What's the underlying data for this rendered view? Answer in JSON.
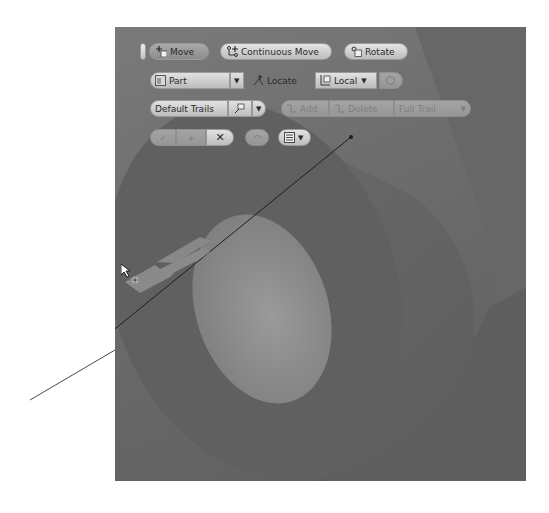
{
  "toolbar": {
    "row1": {
      "move_label": "Move",
      "continuous_move_label": "Continuous Move",
      "rotate_label": "Rotate"
    },
    "row2": {
      "part_label": "Part",
      "locate_label": "Locate",
      "local_label": "Local"
    },
    "row3": {
      "trails_label": "Default Trails",
      "add_label": "Add",
      "delete_label": "Delete",
      "full_trail_label": "Full Trail"
    },
    "row4": {
      "apply_label": "✓",
      "plus_label": "+",
      "close_label": "✕"
    }
  },
  "icons": {
    "move": "move-icon",
    "continuous_move": "continuous-move-icon",
    "rotate": "rotate-icon",
    "part": "part-icon",
    "locate": "locate-icon",
    "local": "local-coordinate-icon",
    "reset": "reset-icon",
    "trail_options": "trail-options-icon",
    "add": "add-trail-icon",
    "delete": "delete-trail-icon",
    "undo": "undo-icon",
    "menu": "menu-icon",
    "cursor": "cursor-arrow-icon"
  },
  "colors": {
    "viewport_bg": "#6e6e6e",
    "part_face": "#5e5e5e",
    "bore_inner": "#8e8e8e",
    "button_face": "#d8d8d8",
    "disabled_face": "#9d9d9d"
  }
}
